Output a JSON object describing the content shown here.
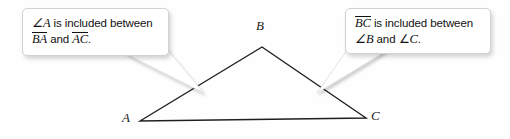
{
  "figure": {
    "name": "triangle-included-parts-diagram",
    "background_color": "#fefefe"
  },
  "callouts": [
    {
      "id": "callout-left",
      "line1_pre": "∠",
      "line1_var": "A",
      "line1_text": " is included between",
      "line2_seg1": "BA",
      "line2_mid": " and ",
      "line2_seg2": "AC",
      "line2_end": "."
    },
    {
      "id": "callout-right",
      "line1_seg": "BC",
      "line1_text": " is included between",
      "line2_pre": "∠",
      "line2_var1": "B",
      "line2_mid": " and ∠",
      "line2_var2": "C",
      "line2_end": "."
    }
  ],
  "triangle": {
    "vertices": [
      {
        "label": "A",
        "x": 140,
        "y": 121
      },
      {
        "label": "B",
        "x": 262,
        "y": 47
      },
      {
        "label": "C",
        "x": 366,
        "y": 118
      }
    ],
    "stroke_color": "#1f1f1f",
    "stroke_width": 1.4,
    "fill": "none"
  },
  "tails": [
    {
      "id": "tail-left",
      "points": "118,52 168,52 205,92 132,60",
      "target": "AB side"
    },
    {
      "id": "tail-right",
      "points": "392,50 352,50 318,92 378,58",
      "target": "BC side"
    }
  ]
}
